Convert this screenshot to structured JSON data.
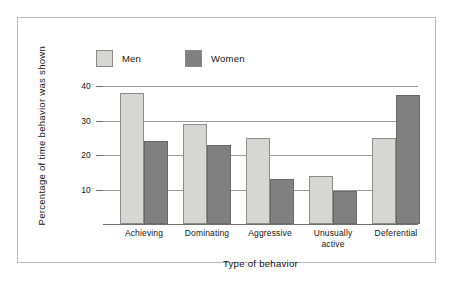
{
  "chart_data": {
    "type": "bar",
    "title": "",
    "xlabel": "Type of behavior",
    "ylabel": "Percentage of time behavior was shown",
    "categories": [
      "Achieving",
      "Dominating",
      "Aggressive",
      "Unusually\nactive",
      "Deferential"
    ],
    "category_labels": [
      {
        "line1": "Achieving",
        "line2": ""
      },
      {
        "line1": "Dominating",
        "line2": ""
      },
      {
        "line1": "Aggressive",
        "line2": ""
      },
      {
        "line1": "Unusually",
        "line2": "active"
      },
      {
        "line1": "Deferential",
        "line2": ""
      }
    ],
    "series": [
      {
        "name": "Men",
        "color": "#d6d6d3",
        "values": [
          38,
          29,
          25,
          14,
          25
        ]
      },
      {
        "name": "Women",
        "color": "#808080",
        "values": [
          24,
          23,
          13,
          9.5,
          37.5
        ]
      }
    ],
    "ylim": [
      0,
      40
    ],
    "yticks": [
      10,
      20,
      30,
      40
    ],
    "ytick_labels": [
      "10",
      "20",
      "30",
      "40"
    ],
    "grid": true,
    "legend_position": "top-left"
  },
  "legend": {
    "entries": [
      {
        "label": "Men",
        "color": "#d6d6d3"
      },
      {
        "label": "Women",
        "color": "#808080"
      }
    ]
  },
  "colors": {
    "men_fill": "#d6d6d3",
    "women_fill": "#808080",
    "gridline": "#9a9a9a",
    "axis": "#6f6f6f",
    "frame": "#b9b9b9",
    "background": "#ffffff"
  }
}
